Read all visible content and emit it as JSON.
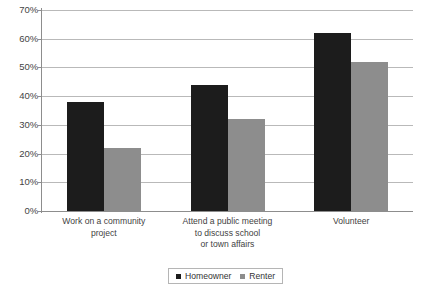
{
  "chart_data": {
    "type": "bar",
    "title": "",
    "subtitle": "",
    "xlabel": "",
    "ylabel": "",
    "ylim": [
      0,
      70
    ],
    "ytick_values": [
      0,
      10,
      20,
      30,
      40,
      50,
      60,
      70
    ],
    "ytick_labels": [
      "0%",
      "10%",
      "20%",
      "30%",
      "40%",
      "50%",
      "60%",
      "70%"
    ],
    "grid": true,
    "legend_position": "bottom-center",
    "categories": [
      "Work on a community project",
      "Attend a public meeting to discuss school or town affairs",
      "Volunteer"
    ],
    "category_label_lines": [
      [
        "Work on a community",
        "project"
      ],
      [
        "Attend a public meeting",
        "to discuss school",
        "or town affairs"
      ],
      [
        "Volunteer"
      ]
    ],
    "series": [
      {
        "name": "Homeowner",
        "color": "#1c1c1c",
        "values": [
          38,
          44,
          62
        ]
      },
      {
        "name": "Renter",
        "color": "#8d8d8d",
        "values": [
          22,
          32,
          52
        ]
      }
    ]
  },
  "legend": {
    "items": [
      {
        "label": "Homeowner"
      },
      {
        "label": "Renter"
      }
    ]
  }
}
